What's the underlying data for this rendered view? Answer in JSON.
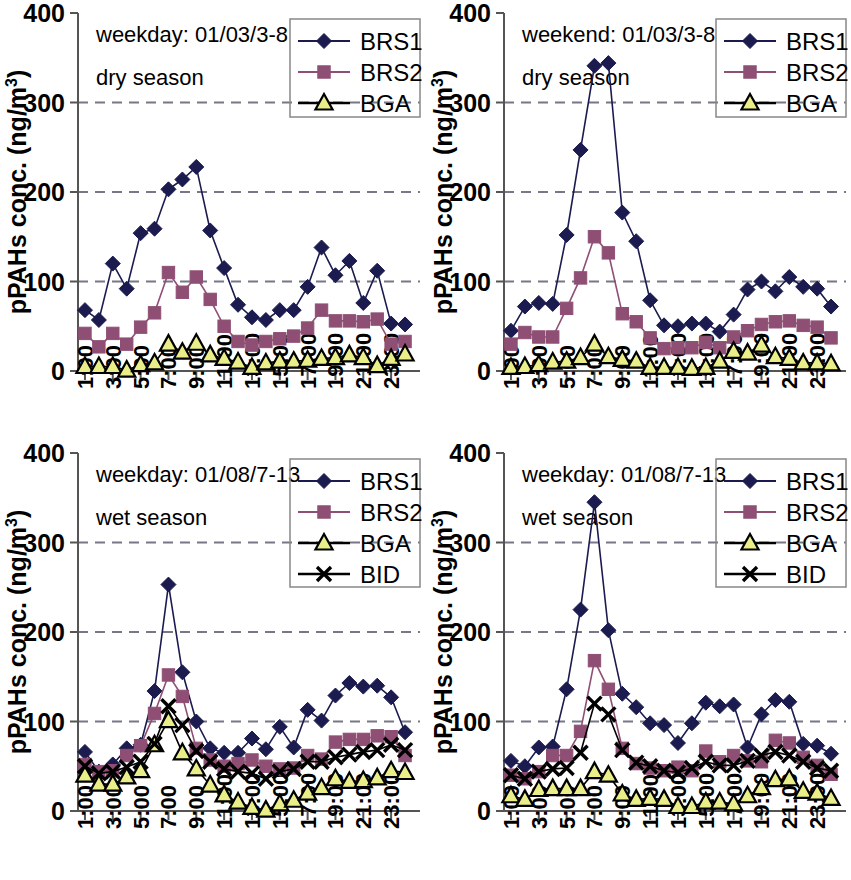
{
  "figure": {
    "width": 851,
    "height": 880,
    "panel_count": 4
  },
  "axis": {
    "ylabel": "pPAHs conc. (ng/m",
    "ylabel_sup": "3",
    "ylabel_tail": ")",
    "yticks": [
      "0",
      "100",
      "200",
      "300",
      "400"
    ],
    "ytick_values": [
      0,
      100,
      200,
      300,
      400
    ],
    "ylim": [
      0,
      400
    ],
    "xticks": [
      "1:00",
      "3:00",
      "5:00",
      "7:00",
      "9:00",
      "11:00",
      "13:00",
      "15:00",
      "17:00",
      "19:00",
      "21:00",
      "23:00"
    ],
    "xtick_hours": [
      1,
      3,
      5,
      7,
      9,
      11,
      13,
      15,
      17,
      19,
      21,
      23
    ],
    "gridlines": [
      100,
      200,
      300
    ]
  },
  "colors": {
    "BRS1": "#1b1b4f",
    "BRS2": "#8f4f74",
    "BGA_fill": "#e9ee88",
    "BGA_stroke": "#000000",
    "BID": "#000000",
    "grid": "#777788",
    "axis": "#555555"
  },
  "chart_data": [
    {
      "type": "line",
      "panel": "top-left",
      "title": "weekday: 01/03/3-8",
      "subtitle": "dry season",
      "xlabel": "",
      "ylabel": "pPAHs conc. (ng/m3)",
      "ylim": [
        0,
        400
      ],
      "grid": true,
      "legend_position": "top-right",
      "x": [
        1,
        2,
        3,
        4,
        5,
        6,
        7,
        8,
        9,
        10,
        11,
        12,
        13,
        14,
        15,
        16,
        17,
        18,
        19,
        20,
        21,
        22,
        23,
        24
      ],
      "xtick_labels": [
        "1:00",
        "3:00",
        "5:00",
        "7:00",
        "9:00",
        "11:00",
        "13:00",
        "15:00",
        "17:00",
        "19:00",
        "21:00",
        "23:00"
      ],
      "series": [
        {
          "name": "BRS1",
          "marker": "diamond",
          "values": [
            68,
            57,
            120,
            92,
            154,
            159,
            203,
            214,
            228,
            157,
            115,
            74,
            60,
            57,
            68,
            68,
            94,
            138,
            107,
            123,
            76,
            112,
            53,
            52
          ]
        },
        {
          "name": "BRS2",
          "marker": "square",
          "values": [
            42,
            27,
            42,
            30,
            49,
            65,
            110,
            88,
            105,
            80,
            50,
            33,
            29,
            33,
            36,
            39,
            48,
            68,
            56,
            56,
            55,
            58,
            30,
            33
          ]
        },
        {
          "name": "BGA",
          "marker": "triangle",
          "values": [
            5,
            5,
            5,
            1,
            7,
            9,
            30,
            21,
            31,
            18,
            14,
            10,
            4,
            9,
            11,
            11,
            12,
            14,
            15,
            18,
            15,
            6,
            14,
            19
          ]
        }
      ]
    },
    {
      "type": "line",
      "panel": "top-right",
      "title": "weekend: 01/03/3-8",
      "subtitle": "dry season",
      "xlabel": "",
      "ylabel": "pPAHs conc. (ng/m3)",
      "ylim": [
        0,
        400
      ],
      "grid": true,
      "legend_position": "top-right",
      "x": [
        1,
        2,
        3,
        4,
        5,
        6,
        7,
        8,
        9,
        10,
        11,
        12,
        13,
        14,
        15,
        16,
        17,
        18,
        19,
        20,
        21,
        22,
        23,
        24
      ],
      "xtick_labels": [
        "1:00",
        "3:00",
        "5:00",
        "7:00",
        "9:00",
        "11:00",
        "13:00",
        "15:00",
        "17:00",
        "19:00",
        "21:00",
        "23:00"
      ],
      "series": [
        {
          "name": "BRS1",
          "marker": "diamond",
          "values": [
            45,
            72,
            76,
            75,
            152,
            247,
            341,
            344,
            177,
            145,
            79,
            51,
            50,
            53,
            53,
            44,
            63,
            91,
            100,
            89,
            105,
            94,
            92,
            72
          ]
        },
        {
          "name": "BRS2",
          "marker": "square",
          "values": [
            30,
            43,
            38,
            38,
            70,
            104,
            150,
            132,
            64,
            55,
            37,
            25,
            26,
            26,
            32,
            26,
            38,
            45,
            52,
            55,
            56,
            51,
            49,
            37
          ]
        },
        {
          "name": "BGA",
          "marker": "triangle",
          "values": [
            4,
            5,
            7,
            10,
            11,
            15,
            30,
            16,
            13,
            11,
            4,
            4,
            4,
            3,
            4,
            11,
            22,
            20,
            29,
            16,
            14,
            9,
            9,
            8
          ]
        }
      ]
    },
    {
      "type": "line",
      "panel": "bottom-left",
      "title": "weekday: 01/08/7-13",
      "subtitle": "wet season",
      "xlabel": "",
      "ylabel": "pPAHs conc. (ng/m3)",
      "ylim": [
        0,
        400
      ],
      "grid": true,
      "legend_position": "top-right",
      "x": [
        1,
        2,
        3,
        4,
        5,
        6,
        7,
        8,
        9,
        10,
        11,
        12,
        13,
        14,
        15,
        16,
        17,
        18,
        19,
        20,
        21,
        22,
        23,
        24
      ],
      "xtick_labels": [
        "1:00",
        "3:00",
        "5:00",
        "7:00",
        "9:00",
        "11:00",
        "13:00",
        "15:00",
        "17:00",
        "19:00",
        "21:00",
        "23:00"
      ],
      "series": [
        {
          "name": "BRS1",
          "marker": "diamond",
          "values": [
            66,
            44,
            52,
            70,
            74,
            134,
            253,
            155,
            100,
            70,
            65,
            65,
            81,
            69,
            94,
            71,
            113,
            101,
            129,
            143,
            139,
            140,
            127,
            88
          ]
        },
        {
          "name": "BRS2",
          "marker": "square",
          "values": [
            52,
            44,
            45,
            62,
            73,
            109,
            152,
            128,
            70,
            57,
            50,
            53,
            57,
            50,
            47,
            48,
            62,
            58,
            77,
            80,
            80,
            84,
            83,
            62
          ]
        },
        {
          "name": "BGA",
          "marker": "triangle",
          "values": [
            40,
            30,
            30,
            38,
            45,
            74,
            101,
            65,
            47,
            29,
            18,
            10,
            4,
            1,
            8,
            12,
            20,
            26,
            36,
            33,
            34,
            37,
            45,
            43
          ]
        },
        {
          "name": "BID",
          "marker": "cross",
          "values": [
            50,
            42,
            44,
            49,
            55,
            75,
            117,
            96,
            67,
            55,
            47,
            44,
            42,
            36,
            44,
            47,
            55,
            55,
            60,
            63,
            66,
            68,
            74,
            68
          ]
        }
      ]
    },
    {
      "type": "line",
      "panel": "bottom-right",
      "title": "weekday: 01/08/7-13",
      "subtitle": "wet season",
      "xlabel": "",
      "ylabel": "pPAHs conc. (ng/m3)",
      "ylim": [
        0,
        400
      ],
      "grid": true,
      "legend_position": "top-right",
      "x": [
        1,
        2,
        3,
        4,
        5,
        6,
        7,
        8,
        9,
        10,
        11,
        12,
        13,
        14,
        15,
        16,
        17,
        18,
        19,
        20,
        21,
        22,
        23,
        24
      ],
      "xtick_labels": [
        "1:00",
        "3:00",
        "5:00",
        "7:00",
        "9:00",
        "11:00",
        "13:00",
        "15:00",
        "17:00",
        "19:00",
        "21:00",
        "23:00"
      ],
      "series": [
        {
          "name": "BRS1",
          "marker": "diamond",
          "values": [
            56,
            50,
            71,
            72,
            136,
            225,
            345,
            202,
            131,
            116,
            98,
            96,
            76,
            98,
            121,
            117,
            119,
            71,
            108,
            124,
            122,
            75,
            73,
            64
          ]
        },
        {
          "name": "BRS2",
          "marker": "square",
          "values": [
            40,
            36,
            44,
            62,
            62,
            89,
            168,
            136,
            70,
            53,
            48,
            45,
            49,
            45,
            67,
            55,
            62,
            56,
            55,
            79,
            76,
            60,
            51,
            41
          ]
        },
        {
          "name": "BGA",
          "marker": "triangle",
          "values": [
            17,
            13,
            24,
            25,
            25,
            25,
            44,
            40,
            19,
            13,
            14,
            13,
            5,
            5,
            10,
            10,
            8,
            17,
            26,
            35,
            36,
            22,
            20,
            14
          ]
        },
        {
          "name": "BID",
          "marker": "cross",
          "values": [
            40,
            36,
            44,
            47,
            48,
            65,
            120,
            108,
            68,
            54,
            50,
            45,
            43,
            48,
            55,
            51,
            51,
            56,
            62,
            66,
            62,
            55,
            48,
            45
          ]
        }
      ]
    }
  ],
  "legends": {
    "three": [
      "BRS1",
      "BRS2",
      "BGA"
    ],
    "four": [
      "BRS1",
      "BRS2",
      "BGA",
      "BID"
    ]
  }
}
